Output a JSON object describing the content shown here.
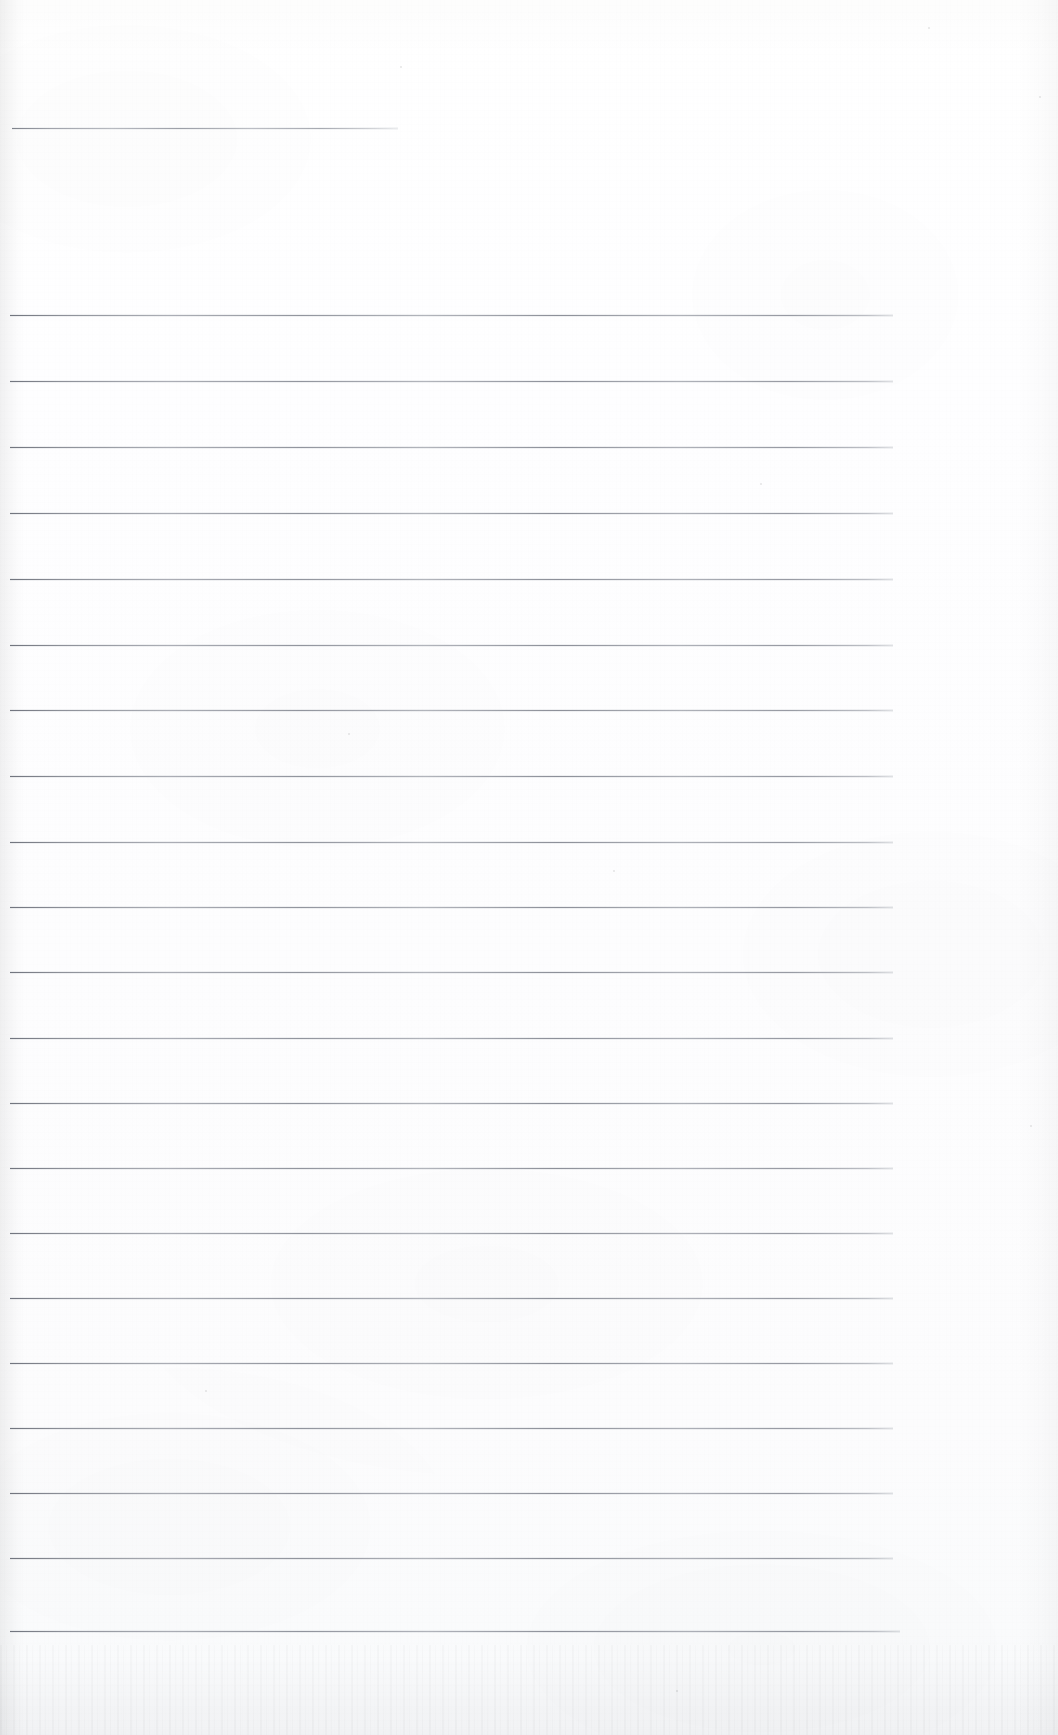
{
  "document": {
    "type": "scanned-lined-notebook-page",
    "title": "Blank ruled notebook page (scan)",
    "orientation": "portrait",
    "page_width_px": 1058,
    "page_height_px": 1735,
    "has_text_content": false,
    "handwriting_present": false,
    "printed_text_present": false,
    "text_blocks": [],
    "annotations": []
  },
  "colors": {
    "paper": "#ffffff",
    "paper_shadow": "#f7f8fa",
    "rule_ink": "#6a6d76",
    "rule_ink_light": "#8c8f99",
    "gutter_shadow": "rgba(0,0,0,0.055)"
  },
  "ruling": {
    "style": "wide-ruled horizontal lines",
    "line_count": 22,
    "line_spacing_px": 65.5,
    "line_thickness_px": 1,
    "margin_left_px": 12,
    "margin_right_px": 895,
    "first_line_y_px": 128,
    "last_line_y_px": 1631,
    "vertical_margin_rule": false,
    "lines": [
      {
        "index": 1,
        "y": 128,
        "x_start": 12,
        "x_end": 398,
        "variant": "short"
      },
      {
        "index": 2,
        "y": 315,
        "x_start": 10,
        "x_end": 893,
        "variant": "full"
      },
      {
        "index": 3,
        "y": 381,
        "x_start": 10,
        "x_end": 893,
        "variant": "full"
      },
      {
        "index": 4,
        "y": 447,
        "x_start": 10,
        "x_end": 893,
        "variant": "full"
      },
      {
        "index": 5,
        "y": 513,
        "x_start": 10,
        "x_end": 893,
        "variant": "full"
      },
      {
        "index": 6,
        "y": 579,
        "x_start": 10,
        "x_end": 893,
        "variant": "full"
      },
      {
        "index": 7,
        "y": 645,
        "x_start": 10,
        "x_end": 893,
        "variant": "full"
      },
      {
        "index": 8,
        "y": 710,
        "x_start": 10,
        "x_end": 893,
        "variant": "full"
      },
      {
        "index": 9,
        "y": 776,
        "x_start": 10,
        "x_end": 893,
        "variant": "full"
      },
      {
        "index": 10,
        "y": 842,
        "x_start": 10,
        "x_end": 893,
        "variant": "full"
      },
      {
        "index": 11,
        "y": 907,
        "x_start": 10,
        "x_end": 893,
        "variant": "full"
      },
      {
        "index": 12,
        "y": 972,
        "x_start": 10,
        "x_end": 893,
        "variant": "full"
      },
      {
        "index": 13,
        "y": 1038,
        "x_start": 10,
        "x_end": 893,
        "variant": "full"
      },
      {
        "index": 14,
        "y": 1103,
        "x_start": 10,
        "x_end": 893,
        "variant": "full"
      },
      {
        "index": 15,
        "y": 1168,
        "x_start": 10,
        "x_end": 893,
        "variant": "full"
      },
      {
        "index": 16,
        "y": 1233,
        "x_start": 10,
        "x_end": 893,
        "variant": "full"
      },
      {
        "index": 17,
        "y": 1298,
        "x_start": 10,
        "x_end": 893,
        "variant": "full"
      },
      {
        "index": 18,
        "y": 1363,
        "x_start": 10,
        "x_end": 893,
        "variant": "full"
      },
      {
        "index": 19,
        "y": 1428,
        "x_start": 10,
        "x_end": 893,
        "variant": "full"
      },
      {
        "index": 20,
        "y": 1493,
        "x_start": 10,
        "x_end": 893,
        "variant": "full"
      },
      {
        "index": 21,
        "y": 1558,
        "x_start": 10,
        "x_end": 893,
        "variant": "full"
      },
      {
        "index": 22,
        "y": 1631,
        "x_start": 10,
        "x_end": 900,
        "variant": "full"
      }
    ]
  },
  "scan_artifacts": {
    "gutter_shadow_side": "left",
    "gutter_shadow_width_px": 26,
    "right_edge_falloff_px": 42,
    "bottom_edge_texture_height_px": 90,
    "paper_grain": "fine vertical fibre",
    "specks": [
      {
        "x": 400,
        "y": 66,
        "size": 2
      },
      {
        "x": 928,
        "y": 27,
        "size": 2
      },
      {
        "x": 1039,
        "y": 96,
        "size": 2
      },
      {
        "x": 760,
        "y": 483,
        "size": 2
      },
      {
        "x": 348,
        "y": 733,
        "size": 2
      },
      {
        "x": 613,
        "y": 870,
        "size": 2
      },
      {
        "x": 1030,
        "y": 1125,
        "size": 2
      },
      {
        "x": 205,
        "y": 1390,
        "size": 2
      },
      {
        "x": 676,
        "y": 1690,
        "size": 2
      }
    ]
  }
}
